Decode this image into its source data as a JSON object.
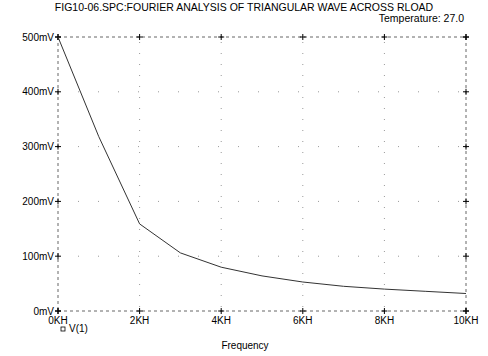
{
  "header": {
    "title": "FIG10-06.SPC:FOURIER ANALYSIS OF TRIANGULAR WAVE ACROSS RLOAD",
    "temperature_label": "Temperature:  27.0"
  },
  "legend": {
    "marker": "▫",
    "label": "V(1)"
  },
  "colors": {
    "trace": "#333333",
    "grid": "#999999",
    "axis": "#666666"
  },
  "chart_data": {
    "type": "line",
    "title": "FIG10-06.SPC:FOURIER ANALYSIS OF TRIANGULAR WAVE ACROSS RLOAD",
    "subtitle": "Temperature: 27.0",
    "xlabel": "Frequency",
    "ylabel": "",
    "x_unit": "KH",
    "y_unit": "mV",
    "xlim": [
      0,
      10
    ],
    "ylim": [
      0,
      500
    ],
    "x_ticks": [
      0,
      2,
      4,
      6,
      8,
      10
    ],
    "x_tick_labels": [
      "0KH",
      "2KH",
      "4KH",
      "6KH",
      "8KH",
      "10KH"
    ],
    "y_ticks": [
      0,
      100,
      200,
      300,
      400,
      500
    ],
    "y_tick_labels": [
      "0mV",
      "100mV",
      "200mV",
      "300mV",
      "400mV",
      "500mV"
    ],
    "grid": true,
    "legend_position": "bottom-left",
    "series": [
      {
        "name": "V(1)",
        "x": [
          0,
          1,
          2,
          3,
          4,
          5,
          6,
          7,
          8,
          9,
          10
        ],
        "values": [
          500,
          318,
          159,
          106,
          80,
          64,
          53,
          45,
          40,
          36,
          32
        ]
      }
    ]
  }
}
